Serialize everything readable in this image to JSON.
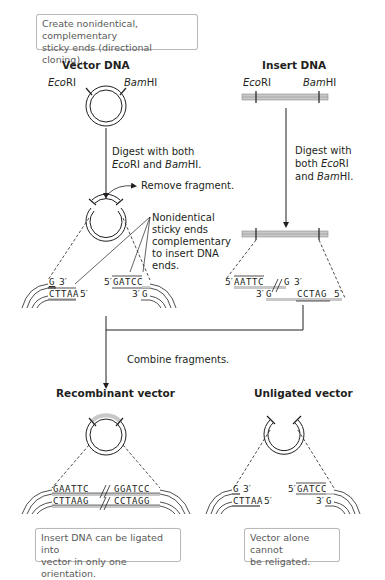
{
  "header_note": {
    "line1": "Create nonidentical, complementary",
    "line2": "sticky ends (directional cloning)."
  },
  "vector": {
    "title": "Vector DNA",
    "site_left": {
      "italic": "Eco",
      "rest": "RI"
    },
    "site_right": {
      "italic": "Bam",
      "rest": "HI"
    },
    "digest": {
      "line1": "Digest with both",
      "line2_italic1": "Eco",
      "line2_rest1": "RI and ",
      "line2_italic2": "Bam",
      "line2_rest2": "HI."
    },
    "remove_label": "Remove fragment.",
    "callout": [
      "Nonidentical",
      "sticky ends",
      "complementary",
      "to insert DNA",
      "ends."
    ],
    "left_end": {
      "top": "G",
      "top_label": "3′",
      "bottom": "CTTAA",
      "bottom_label": "5′"
    },
    "right_end": {
      "top_label": "5′",
      "top": "GATCC",
      "bottom_label": "3′",
      "bottom": "G"
    }
  },
  "insert": {
    "title": "Insert DNA",
    "site_left": {
      "italic": "Eco",
      "rest": "RI"
    },
    "site_right": {
      "italic": "Bam",
      "rest": "HI"
    },
    "digest": {
      "line1": "Digest with",
      "line2_plain": "both ",
      "line2_italic": "Eco",
      "line2_rest": "RI",
      "line3_plain": "and ",
      "line3_italic": "Bam",
      "line3_rest": "HI."
    },
    "top_strand": {
      "label_left": "5′",
      "seq_left": "AATTC",
      "seq_right": "G",
      "label_right": "3′"
    },
    "bottom_strand": {
      "label_left": "3′",
      "seq_left": "G",
      "seq_right": "CCTAG",
      "label_right": "5′"
    }
  },
  "combine_label": "Combine fragments.",
  "recombinant": {
    "title": "Recombinant vector",
    "top_left": "GAATTC",
    "top_right": "GGATCC",
    "bottom_left": "CTTAAG",
    "bottom_right": "CCTAGG",
    "note": {
      "line1": "Insert DNA can be ligated into",
      "line2": "vector in only one orientation."
    }
  },
  "unligated": {
    "title": "Unligated vector",
    "left_end": {
      "top": "G",
      "top_label": "3′",
      "bottom": "CTTAA",
      "bottom_label": "5′"
    },
    "right_end": {
      "top_label": "5′",
      "top": "GATCC",
      "bottom_label": "3′",
      "bottom": "G"
    },
    "note": {
      "line1": "Vector alone cannot",
      "line2": "be religated."
    }
  },
  "colors": {
    "ink": "#231f20",
    "insert_fill": "#c8c8c8",
    "note_border": "#b8b8b8",
    "note_text": "#5a5a5a"
  }
}
